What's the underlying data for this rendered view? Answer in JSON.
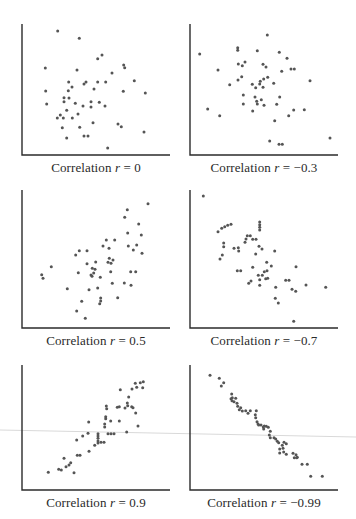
{
  "colors": {
    "axis": "#2b2b2b",
    "dot": "#555555",
    "text": "#2a2a2a",
    "artifact": "#d9d9d9"
  },
  "chart_data": [
    {
      "type": "scatter",
      "title": "Correlation r = 0",
      "caption": {
        "prefix": "Correlation ",
        "var": "r",
        "suffix": " = 0"
      },
      "r": 0,
      "xlabel": "",
      "ylabel": "",
      "grid": false,
      "box": {
        "x0": 22,
        "y0": 24,
        "x1": 170,
        "y1": 155
      },
      "caption_pos": {
        "x": 96,
        "y": 160
      },
      "points": [
        [
          57.7,
          31
        ],
        [
          79.3,
          38.3
        ],
        [
          97.7,
          58.7
        ],
        [
          102,
          55
        ],
        [
          45.3,
          68
        ],
        [
          77,
          70
        ],
        [
          123.7,
          65
        ],
        [
          124.7,
          67.7
        ],
        [
          112,
          73
        ],
        [
          134.3,
          80.7
        ],
        [
          68.7,
          82
        ],
        [
          72,
          87
        ],
        [
          84,
          84
        ],
        [
          86,
          82
        ],
        [
          97.7,
          82
        ],
        [
          105.7,
          82
        ],
        [
          94,
          89
        ],
        [
          68.3,
          90.7
        ],
        [
          45.7,
          91
        ],
        [
          123.3,
          91.3
        ],
        [
          145.3,
          93
        ],
        [
          64,
          97.7
        ],
        [
          69,
          98
        ],
        [
          64,
          101.7
        ],
        [
          46.7,
          104
        ],
        [
          75.3,
          103.3
        ],
        [
          83,
          106
        ],
        [
          91,
          101.7
        ],
        [
          91,
          107
        ],
        [
          99.3,
          102.3
        ],
        [
          105,
          106
        ],
        [
          66.7,
          110.3
        ],
        [
          60.3,
          115
        ],
        [
          57.3,
          118
        ],
        [
          63.3,
          118
        ],
        [
          72.3,
          118
        ],
        [
          78,
          114
        ],
        [
          93,
          122.7
        ],
        [
          118,
          124
        ],
        [
          121.3,
          126.7
        ],
        [
          62.3,
          127.7
        ],
        [
          79.7,
          127.3
        ],
        [
          144,
          132
        ],
        [
          84,
          136
        ],
        [
          88,
          136
        ],
        [
          66.7,
          138
        ],
        [
          107.7,
          148
        ]
      ]
    },
    {
      "type": "scatter",
      "title": "Correlation r = −0.3",
      "caption": {
        "prefix": "Correlation ",
        "var": "r",
        "suffix": " = −0.3"
      },
      "r": -0.3,
      "xlabel": "",
      "ylabel": "",
      "grid": false,
      "box": {
        "x0": 190,
        "y0": 24,
        "x1": 338,
        "y1": 155
      },
      "caption_pos": {
        "x": 264,
        "y": 160
      },
      "points": [
        [
          267.3,
          35
        ],
        [
          199.7,
          54
        ],
        [
          237.7,
          47.7
        ],
        [
          237.7,
          50.3
        ],
        [
          257.3,
          50.7
        ],
        [
          279.3,
          52.3
        ],
        [
          287,
          58.3
        ],
        [
          238.3,
          64
        ],
        [
          242.3,
          65.7
        ],
        [
          245,
          62
        ],
        [
          263,
          64.3
        ],
        [
          266,
          67
        ],
        [
          218,
          70
        ],
        [
          281.7,
          71.3
        ],
        [
          291,
          69
        ],
        [
          294.3,
          69
        ],
        [
          241.7,
          76.7
        ],
        [
          238,
          80
        ],
        [
          267.7,
          77.3
        ],
        [
          263.7,
          79
        ],
        [
          260.3,
          81.3
        ],
        [
          259.7,
          84
        ],
        [
          252.3,
          84.3
        ],
        [
          255.7,
          87.7
        ],
        [
          263,
          87.3
        ],
        [
          273.7,
          83.3
        ],
        [
          229.7,
          84.7
        ],
        [
          310,
          80.7
        ],
        [
          243.3,
          95
        ],
        [
          255,
          97
        ],
        [
          279.7,
          97
        ],
        [
          261.3,
          99.7
        ],
        [
          256.7,
          101.3
        ],
        [
          257.3,
          104
        ],
        [
          264,
          105.3
        ],
        [
          243.3,
          104
        ],
        [
          276.7,
          104.3
        ],
        [
          293.7,
          110
        ],
        [
          304.3,
          109.7
        ],
        [
          207.7,
          109
        ],
        [
          252.7,
          111
        ],
        [
          219.7,
          115.7
        ],
        [
          288.7,
          115.7
        ],
        [
          274.7,
          120.7
        ],
        [
          269.7,
          141
        ],
        [
          279,
          144.3
        ],
        [
          282.3,
          144.3
        ],
        [
          330,
          138
        ]
      ]
    },
    {
      "type": "scatter",
      "title": "Correlation r = 0.5",
      "caption": {
        "prefix": "Correlation ",
        "var": "r",
        "suffix": " = 0.5"
      },
      "r": 0.5,
      "xlabel": "",
      "ylabel": "",
      "grid": false,
      "box": {
        "x0": 22,
        "y0": 190,
        "x1": 170,
        "y1": 328
      },
      "caption_pos": {
        "x": 96,
        "y": 333
      },
      "points": [
        [
          148,
          203.7
        ],
        [
          127.3,
          209.7
        ],
        [
          124.7,
          217.3
        ],
        [
          138.7,
          224
        ],
        [
          127.7,
          233
        ],
        [
          141.3,
          235
        ],
        [
          136.7,
          245
        ],
        [
          128.3,
          246
        ],
        [
          133.3,
          250
        ],
        [
          142,
          253.3
        ],
        [
          106.3,
          240
        ],
        [
          114.7,
          240
        ],
        [
          103,
          246
        ],
        [
          109,
          248.3
        ],
        [
          79.3,
          250.7
        ],
        [
          87,
          250.7
        ],
        [
          75.7,
          255
        ],
        [
          109.3,
          258.3
        ],
        [
          108,
          262.3
        ],
        [
          113,
          260
        ],
        [
          111,
          263.3
        ],
        [
          87,
          263.7
        ],
        [
          95.7,
          262
        ],
        [
          51.3,
          266.7
        ],
        [
          92.3,
          268.3
        ],
        [
          95,
          269.3
        ],
        [
          93.7,
          273
        ],
        [
          91,
          275
        ],
        [
          92,
          276.3
        ],
        [
          110.7,
          271.7
        ],
        [
          78.3,
          272.7
        ],
        [
          130.7,
          271.7
        ],
        [
          135.7,
          271.7
        ],
        [
          41.7,
          274.7
        ],
        [
          43,
          278.3
        ],
        [
          100.3,
          277.3
        ],
        [
          112.3,
          283.3
        ],
        [
          124.3,
          283
        ],
        [
          131,
          285.3
        ],
        [
          67.3,
          288.7
        ],
        [
          89,
          289.7
        ],
        [
          97.7,
          288
        ],
        [
          100.7,
          298
        ],
        [
          100.7,
          301
        ],
        [
          99.7,
          303.7
        ],
        [
          117.7,
          297.7
        ],
        [
          81.7,
          301.3
        ],
        [
          76.7,
          311
        ],
        [
          85.3,
          318.3
        ]
      ]
    },
    {
      "type": "scatter",
      "title": "Correlation r = −0.7",
      "caption": {
        "prefix": "Correlation ",
        "var": "r",
        "suffix": " = −0.7"
      },
      "r": -0.7,
      "xlabel": "",
      "ylabel": "",
      "grid": false,
      "box": {
        "x0": 190,
        "y0": 190,
        "x1": 338,
        "y1": 328
      },
      "caption_pos": {
        "x": 264,
        "y": 333
      },
      "points": [
        [
          203.3,
          196
        ],
        [
          218,
          231.7
        ],
        [
          221.7,
          228.3
        ],
        [
          224.7,
          226.7
        ],
        [
          227.7,
          225.3
        ],
        [
          231,
          224.3
        ],
        [
          259.7,
          222
        ],
        [
          259.7,
          224.7
        ],
        [
          259.7,
          227.3
        ],
        [
          259.7,
          230
        ],
        [
          247.3,
          235.7
        ],
        [
          250.3,
          235.7
        ],
        [
          246,
          239
        ],
        [
          252.7,
          239.3
        ],
        [
          256,
          239.3
        ],
        [
          223.7,
          243
        ],
        [
          223.7,
          246.7
        ],
        [
          245,
          242.3
        ],
        [
          234,
          248.3
        ],
        [
          238.3,
          247.7
        ],
        [
          238.7,
          251
        ],
        [
          259,
          246.3
        ],
        [
          262,
          249
        ],
        [
          255.7,
          254
        ],
        [
          274.7,
          251
        ],
        [
          222.3,
          255
        ],
        [
          220,
          259
        ],
        [
          266.7,
          262.3
        ],
        [
          252.7,
          267.3
        ],
        [
          271.3,
          266
        ],
        [
          296,
          266.7
        ],
        [
          267,
          270.7
        ],
        [
          264.3,
          271.7
        ],
        [
          237.3,
          270.7
        ],
        [
          240.7,
          270.7
        ],
        [
          262.3,
          275.3
        ],
        [
          258.3,
          275.3
        ],
        [
          259.7,
          279.7
        ],
        [
          265.7,
          278.7
        ],
        [
          267.7,
          278.3
        ],
        [
          285.7,
          280.3
        ],
        [
          289,
          280.3
        ],
        [
          251,
          281
        ],
        [
          248.7,
          283.3
        ],
        [
          259.7,
          285.3
        ],
        [
          275.7,
          287.3
        ],
        [
          306,
          285
        ],
        [
          325.7,
          287.3
        ],
        [
          292,
          289.3
        ],
        [
          295.7,
          291.3
        ],
        [
          275.3,
          298.3
        ],
        [
          278.3,
          303
        ],
        [
          293.7,
          321.3
        ]
      ]
    },
    {
      "type": "scatter",
      "title": "Correlation r = 0.9",
      "caption": {
        "prefix": "Correlation ",
        "var": "r",
        "suffix": " = 0.9"
      },
      "r": 0.9,
      "xlabel": "",
      "ylabel": "",
      "grid": false,
      "box": {
        "x0": 22,
        "y0": 365,
        "x1": 170,
        "y1": 490
      },
      "caption_pos": {
        "x": 96,
        "y": 495
      },
      "points": [
        [
          143.3,
          381.7
        ],
        [
          140.3,
          382.7
        ],
        [
          135.3,
          383.3
        ],
        [
          136.7,
          387.3
        ],
        [
          142.7,
          387.7
        ],
        [
          132,
          389
        ],
        [
          120.3,
          389.7
        ],
        [
          128.7,
          397
        ],
        [
          127.3,
          403
        ],
        [
          127.7,
          405.7
        ],
        [
          131.7,
          406.7
        ],
        [
          125,
          408
        ],
        [
          133,
          407.7
        ],
        [
          106.3,
          406
        ],
        [
          106.7,
          408.7
        ],
        [
          117.3,
          407.3
        ],
        [
          119.3,
          406.7
        ],
        [
          135.7,
          413
        ],
        [
          105.7,
          416.7
        ],
        [
          105.7,
          418.7
        ],
        [
          110.7,
          421
        ],
        [
          104.7,
          424
        ],
        [
          104.7,
          427
        ],
        [
          119.3,
          421
        ],
        [
          138,
          426
        ],
        [
          88.7,
          422
        ],
        [
          126.7,
          432
        ],
        [
          98,
          433.7
        ],
        [
          98,
          436
        ],
        [
          98,
          438.3
        ],
        [
          98,
          441
        ],
        [
          98,
          443
        ],
        [
          108,
          433.7
        ],
        [
          111,
          433.7
        ],
        [
          114,
          433.7
        ],
        [
          88,
          433.3
        ],
        [
          82.7,
          436
        ],
        [
          101,
          442.3
        ],
        [
          104,
          442.3
        ],
        [
          76.7,
          440
        ],
        [
          94.7,
          445.3
        ],
        [
          89,
          451.3
        ],
        [
          77.3,
          455.3
        ],
        [
          80,
          455.3
        ],
        [
          64,
          458.3
        ],
        [
          70.7,
          462.7
        ],
        [
          69,
          465
        ],
        [
          66,
          466.7
        ],
        [
          58.7,
          469.3
        ],
        [
          61.3,
          470
        ],
        [
          74,
          472.7
        ],
        [
          48.3,
          472.3
        ]
      ]
    },
    {
      "type": "scatter",
      "title": "Correlation r = −0.99",
      "caption": {
        "prefix": "Correlation ",
        "var": "r",
        "suffix": " = −0.99"
      },
      "r": -0.99,
      "xlabel": "",
      "ylabel": "",
      "grid": false,
      "box": {
        "x0": 190,
        "y0": 365,
        "x1": 338,
        "y1": 490
      },
      "caption_pos": {
        "x": 264,
        "y": 495
      },
      "points": [
        [
          210,
          375.3
        ],
        [
          219.3,
          378.3
        ],
        [
          223.7,
          382.7
        ],
        [
          221.3,
          386
        ],
        [
          231.7,
          394
        ],
        [
          232.3,
          397.7
        ],
        [
          235.7,
          398.3
        ],
        [
          231,
          398.7
        ],
        [
          232,
          400.7
        ],
        [
          234,
          401.7
        ],
        [
          237,
          403.3
        ],
        [
          237.7,
          406.3
        ],
        [
          239.3,
          409.7
        ],
        [
          240.7,
          407.7
        ],
        [
          242.3,
          411
        ],
        [
          245.7,
          410.7
        ],
        [
          248,
          413.3
        ],
        [
          250.3,
          410.7
        ],
        [
          256.3,
          410.7
        ],
        [
          255.3,
          414.7
        ],
        [
          255.7,
          417.7
        ],
        [
          257,
          421.7
        ],
        [
          258,
          424
        ],
        [
          258.7,
          425
        ],
        [
          261,
          425
        ],
        [
          263.3,
          427
        ],
        [
          263.7,
          429
        ],
        [
          264.3,
          426
        ],
        [
          266.3,
          426.3
        ],
        [
          268.3,
          427.3
        ],
        [
          270.3,
          431.3
        ],
        [
          269.3,
          435
        ],
        [
          270.3,
          437.7
        ],
        [
          274,
          437.7
        ],
        [
          275.7,
          439
        ],
        [
          277.3,
          441.3
        ],
        [
          278.7,
          442.7
        ],
        [
          284,
          442.3
        ],
        [
          282.3,
          445.3
        ],
        [
          279.7,
          449
        ],
        [
          283,
          448.3
        ],
        [
          286.3,
          443.7
        ],
        [
          283.7,
          452
        ],
        [
          279.7,
          453
        ],
        [
          286.3,
          454.3
        ],
        [
          293,
          453.3
        ],
        [
          296,
          454.7
        ],
        [
          297.3,
          457.3
        ],
        [
          294.3,
          457.7
        ],
        [
          296.7,
          457.7
        ],
        [
          302,
          464.3
        ],
        [
          307.3,
          464.3
        ],
        [
          310.7,
          476.3
        ],
        [
          322.3,
          476.3
        ]
      ]
    }
  ]
}
